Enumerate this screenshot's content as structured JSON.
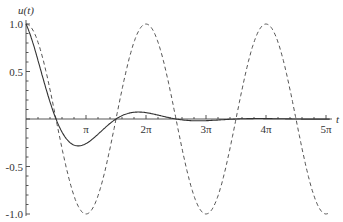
{
  "chart_data": {
    "type": "line",
    "title": "",
    "xlabel": "t",
    "ylabel": "u(t)",
    "xlim": [
      0,
      15.9
    ],
    "ylim": [
      -1.0,
      1.0
    ],
    "x_ticks": [
      "π",
      "2π",
      "3π",
      "4π",
      "5π"
    ],
    "x_tick_values": [
      3.1416,
      6.2832,
      9.4248,
      12.5664,
      15.708
    ],
    "y_ticks": [
      "1.0",
      "0.5",
      "-0.5",
      "-1.0"
    ],
    "y_tick_values": [
      1.0,
      0.5,
      -0.5,
      -1.0
    ],
    "grid": false,
    "legend": null,
    "series": [
      {
        "name": "solid (damped)",
        "style": "solid",
        "x": [
          0,
          0.5,
          1.0,
          1.5,
          2.0,
          2.5,
          2.83,
          3.5,
          4.0,
          4.66,
          5.5,
          6.28,
          7.0,
          7.85,
          9.0,
          10.0,
          12.0,
          14.0,
          15.9
        ],
        "y": [
          1.0,
          0.71,
          0.35,
          0.04,
          -0.18,
          -0.27,
          -0.27,
          -0.21,
          -0.12,
          0.0,
          0.07,
          0.07,
          0.04,
          0.0,
          -0.02,
          -0.01,
          0.0,
          0.0,
          0.0
        ]
      },
      {
        "name": "dashed (cos t)",
        "style": "dashed",
        "x": [
          0,
          1.5708,
          3.1416,
          4.7124,
          6.2832,
          7.854,
          9.4248,
          10.9956,
          12.5664,
          14.1372,
          15.708
        ],
        "y": [
          1,
          0,
          -1,
          0,
          1,
          0,
          -1,
          0,
          1,
          0,
          -1
        ]
      }
    ]
  }
}
